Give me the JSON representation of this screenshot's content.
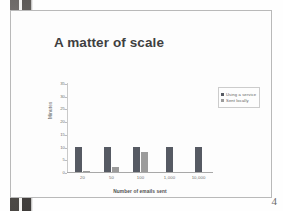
{
  "slide": {
    "title": "A matter of scale",
    "page_number": "4"
  },
  "chart_data": {
    "type": "bar",
    "title": "",
    "xlabel": "Number of emails sent",
    "ylabel": "Minutes",
    "categories": [
      "20",
      "50",
      "100",
      "1,000",
      "10,000"
    ],
    "series": [
      {
        "name": "Using a service",
        "color": "#565a63",
        "values": [
          10,
          10,
          10,
          10,
          10
        ]
      },
      {
        "name": "Sent locally",
        "color": "#9b9b9b",
        "values": [
          0.5,
          2,
          8,
          0,
          0
        ]
      }
    ],
    "ylim": [
      0,
      35
    ],
    "yticks": [
      "0",
      "5",
      "10",
      "15",
      "20",
      "25",
      "30",
      "35"
    ],
    "grid": false,
    "legend_position": "right"
  }
}
